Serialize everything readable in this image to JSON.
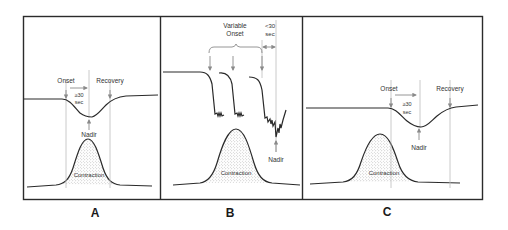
{
  "figure": {
    "panels": [
      {
        "id": "A",
        "label": "A",
        "annotations": {
          "onset": "Onset",
          "recovery": "Recovery",
          "duration_line1": "≥30",
          "duration_line2": "sec",
          "nadir": "Nadir",
          "contraction": "Contraction"
        }
      },
      {
        "id": "B",
        "label": "B",
        "annotations": {
          "variable_line1": "Variable",
          "variable_line2": "Onset",
          "duration_line1": "<30",
          "duration_line2": "sec",
          "nadir": "Nadir",
          "contraction": "Contraction"
        }
      },
      {
        "id": "C",
        "label": "C",
        "annotations": {
          "onset": "Onset",
          "recovery": "Recovery",
          "duration_line1": "≥30",
          "duration_line2": "sec",
          "nadir": "Nadir",
          "contraction": "Contraction"
        }
      }
    ],
    "colors": {
      "line": "#2a2a2a",
      "guide": "#bdbdbd",
      "arrow": "#8a8a8a",
      "stipple": "#9a9a9a",
      "frame": "#2b2b2b"
    }
  }
}
